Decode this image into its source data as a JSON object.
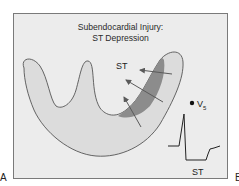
{
  "figure": {
    "title_line1": "Subendocardial Injury:",
    "title_line2": "ST Depression",
    "st_vector_label": "ST",
    "lead_label": "V",
    "lead_subscript": "5",
    "ecg_st_label": "ST",
    "panel_letter_left": "A",
    "panel_letter_right": "B"
  },
  "colors": {
    "background": "#ececec",
    "frame": "#7a7a7a",
    "ventricle_fill": "#dcdcdc",
    "injury_zone": "#8c8c8c",
    "outline": "#555555",
    "arrow": "#5a5a5a",
    "ecg_trace": "#222222"
  }
}
